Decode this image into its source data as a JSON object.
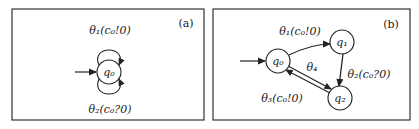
{
  "panels": [
    {
      "tag": "(a)",
      "states": [
        {
          "id": "q0",
          "label": "q₀",
          "initial": true
        }
      ],
      "transitions": [
        {
          "from": "q0",
          "to": "q0",
          "label": "θ₁(c₀!0)",
          "position": "top"
        },
        {
          "from": "q0",
          "to": "q0",
          "label": "θ₂(c₀?0)",
          "position": "bottom"
        }
      ]
    },
    {
      "tag": "(b)",
      "states": [
        {
          "id": "q0",
          "label": "q₀",
          "initial": true
        },
        {
          "id": "q1",
          "label": "q₁",
          "initial": false
        },
        {
          "id": "q2",
          "label": "q₂",
          "initial": false
        }
      ],
      "transitions": [
        {
          "from": "q0",
          "to": "q1",
          "label": "θ₁(c₀!0)"
        },
        {
          "from": "q1",
          "to": "q2",
          "label": "θ₂(c₀?0)"
        },
        {
          "from": "q2",
          "to": "q0",
          "label": "θ₃(c₀!0)"
        },
        {
          "from": "q0",
          "to": "q2",
          "label": "θ₄"
        }
      ]
    }
  ],
  "colors": {
    "stroke": "#222222",
    "background": "#ffffff"
  }
}
